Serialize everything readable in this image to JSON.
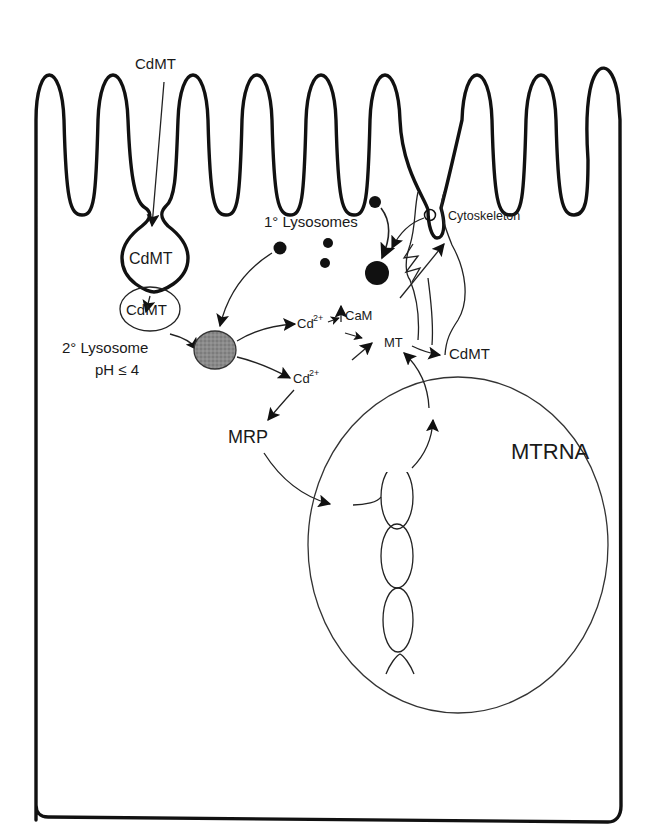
{
  "diagram": {
    "labels": {
      "cdmt_extracellular": "CdMT",
      "cdmt_endocytic_vesicle": "CdMT",
      "cdmt_endosome": "CdMT",
      "primary_lysosomes": "1° Lysosomes",
      "secondary_lysosome": "2° Lysosome",
      "secondary_lysosome_ph": "pH ≤ 4",
      "cadmium_ion_upper": "Cd",
      "cadmium_ion_upper_charge": "2+",
      "cadmium_ion_lower": "Cd",
      "cadmium_ion_lower_charge": "2+",
      "calmodulin": "CaM",
      "metallothionein": "MT",
      "cdmt_cytosolic": "CdMT",
      "cytoskeleton": "Cytoskeleton",
      "mrp": "MRP",
      "mt_rna": "MTRNA"
    },
    "nodes": [
      {
        "id": "cdmt_extracellular",
        "label": "CdMT",
        "shape": "text"
      },
      {
        "id": "cdmt_endocytic_vesicle",
        "label": "CdMT",
        "shape": "vesicle (budding from membrane)"
      },
      {
        "id": "cdmt_endosome",
        "label": "CdMT",
        "shape": "ellipse"
      },
      {
        "id": "primary_lysosomes",
        "label": "1° Lysosomes",
        "shape": "black dots"
      },
      {
        "id": "secondary_lysosome",
        "label": "2° Lysosome pH ≤ 4",
        "shape": "shaded ellipse"
      },
      {
        "id": "cd_upper",
        "label": "Cd2+",
        "shape": "text"
      },
      {
        "id": "cd_lower",
        "label": "Cd2+",
        "shape": "text"
      },
      {
        "id": "cam",
        "label": "CaM",
        "shape": "text"
      },
      {
        "id": "mt",
        "label": "MT",
        "shape": "text"
      },
      {
        "id": "cdmt_cytosolic",
        "label": "CdMT",
        "shape": "text"
      },
      {
        "id": "cytoskeleton",
        "label": "Cytoskeleton",
        "shape": "wavy lines"
      },
      {
        "id": "mrp",
        "label": "MRP",
        "shape": "text"
      },
      {
        "id": "nucleus",
        "label": "MTRNA",
        "shape": "large circle with RNA strand"
      }
    ],
    "edges": [
      {
        "from": "cdmt_extracellular",
        "to": "cdmt_endocytic_vesicle"
      },
      {
        "from": "cdmt_endocytic_vesicle",
        "to": "cdmt_endosome"
      },
      {
        "from": "cdmt_endosome",
        "to": "secondary_lysosome"
      },
      {
        "from": "primary_lysosomes",
        "to": "secondary_lysosome"
      },
      {
        "from": "primary_lysosomes",
        "to": "large_lysosome"
      },
      {
        "from": "secondary_lysosome",
        "to": "cd_upper"
      },
      {
        "from": "secondary_lysosome",
        "to": "cd_lower"
      },
      {
        "from": "cd_upper",
        "to": "cam"
      },
      {
        "from": "cd_upper",
        "to": "mt"
      },
      {
        "from": "cd_lower",
        "to": "mt"
      },
      {
        "from": "cd_lower",
        "to": "mrp"
      },
      {
        "from": "cam",
        "to": "large_lysosome"
      },
      {
        "from": "cam",
        "to": "cytoskeleton"
      },
      {
        "from": "mrp",
        "to": "nucleus"
      },
      {
        "from": "nucleus",
        "to": "mt"
      },
      {
        "from": "mt",
        "to": "cdmt_cytosolic"
      }
    ]
  }
}
